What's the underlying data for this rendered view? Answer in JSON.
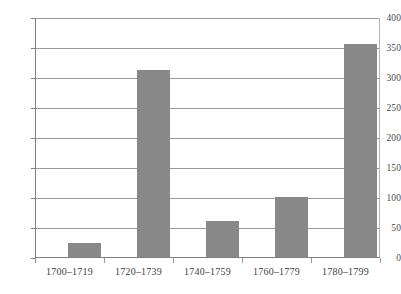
{
  "chart_data": {
    "type": "bar",
    "title": "",
    "xlabel": "",
    "ylabel": "",
    "categories": [
      "1700–1719",
      "1720–1739",
      "1740–1759",
      "1760–1779",
      "1780–1799"
    ],
    "values": [
      23,
      313,
      60,
      100,
      357
    ],
    "series": [
      {
        "name": "",
        "values": [
          23,
          313,
          60,
          100,
          357
        ]
      }
    ],
    "ylim": [
      0,
      400
    ],
    "yticks": [
      0,
      50,
      100,
      150,
      200,
      250,
      300,
      350,
      400
    ],
    "ytick_labels": [
      "0",
      "50",
      "100",
      "150",
      "200",
      "250",
      "300",
      "350",
      "400"
    ],
    "grid": true,
    "grid_axis": "y",
    "legend": false,
    "legend_position": "none",
    "bar_color": "#888888",
    "grid_color": "#9a9a9a",
    "axis_color": "#808080",
    "background_color": "#ffffff"
  }
}
